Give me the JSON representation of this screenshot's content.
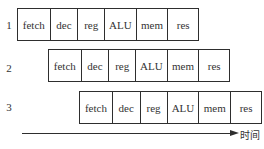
{
  "diagram": {
    "type": "instruction-pipeline",
    "rows": [
      {
        "label": "1",
        "stages": [
          "fetch",
          "dec",
          "reg",
          "ALU",
          "mem",
          "res"
        ]
      },
      {
        "label": "2",
        "stages": [
          "fetch",
          "dec",
          "reg",
          "ALU",
          "mem",
          "res"
        ]
      },
      {
        "label": "3",
        "stages": [
          "fetch",
          "dec",
          "reg",
          "ALU",
          "mem",
          "res"
        ]
      }
    ],
    "axis": {
      "label": "时间"
    },
    "colors": {
      "line": "#2e2e2e",
      "text": "#333333",
      "background": "#ffffff"
    }
  }
}
